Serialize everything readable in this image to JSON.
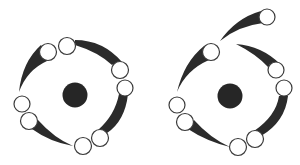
{
  "figure": {
    "colors": {
      "background": "#ffffff",
      "nucleus": "#262626",
      "tail": "#2b2b2b",
      "orb_outline": "#3a3a3a",
      "orb_fill": "#ffffff"
    },
    "panels": [
      {
        "id": "left",
        "label": "closed-ring",
        "nucleus_count": 1,
        "orb_count": 8,
        "tail_count": 4,
        "arrangement": "four pairs of circles evenly spaced around the nucleus, each pair joined by a tapered dark tail"
      },
      {
        "id": "right",
        "label": "spiral-opening",
        "nucleus_count": 1,
        "orb_count": 8,
        "tail_count": 5,
        "arrangement": "same ring, with the upper arc broken open so one circle with its tail is flung outward to the top-right"
      }
    ]
  }
}
